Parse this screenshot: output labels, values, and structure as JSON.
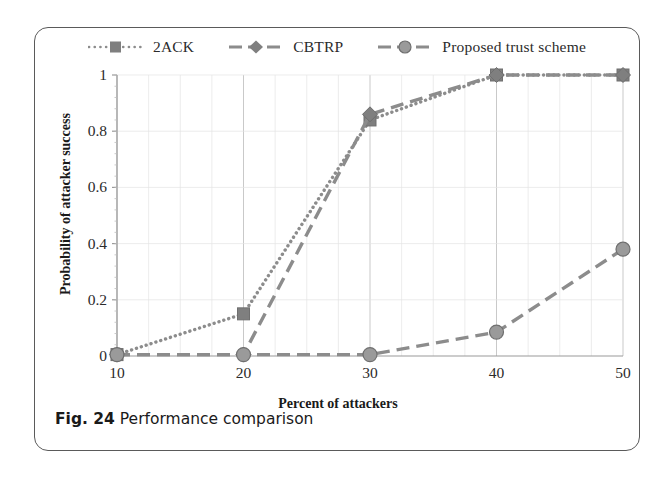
{
  "figure": {
    "caption_number": "Fig. 24",
    "caption_text": "Performance comparison"
  },
  "colors": {
    "series_gray": "#8c8c8c",
    "marker_gray": "#7f7f7f",
    "axis": "#9a9a9a",
    "grid": "#d8d8d8",
    "text": "#2b2b2b",
    "border": "#5a5a5a"
  },
  "chart_data": {
    "type": "line",
    "title": "",
    "xlabel": "Percent of attackers",
    "ylabel": "Probability of attacker success",
    "x": [
      10,
      20,
      30,
      40,
      50
    ],
    "xticklabels": [
      "10",
      "20",
      "30",
      "40",
      "50"
    ],
    "yticklabels": [
      "0",
      "0.2",
      "0.4",
      "0.6",
      "0.8",
      "1"
    ],
    "yticks": [
      0,
      0.2,
      0.4,
      0.6,
      0.8,
      1
    ],
    "xlim": [
      10,
      50
    ],
    "ylim": [
      0,
      1
    ],
    "grid": true,
    "legend_position": "top",
    "series": [
      {
        "name": "2ACK",
        "values": [
          0.005,
          0.15,
          0.84,
          1.0,
          1.0
        ],
        "linestyle": "dotted",
        "marker": "square"
      },
      {
        "name": "CBTRP",
        "values": [
          0.005,
          0.005,
          0.86,
          1.0,
          1.0
        ],
        "linestyle": "dashed",
        "marker": "diamond"
      },
      {
        "name": "Proposed trust scheme",
        "values": [
          0.005,
          0.005,
          0.005,
          0.085,
          0.38
        ],
        "linestyle": "dashed",
        "marker": "circle"
      }
    ]
  }
}
